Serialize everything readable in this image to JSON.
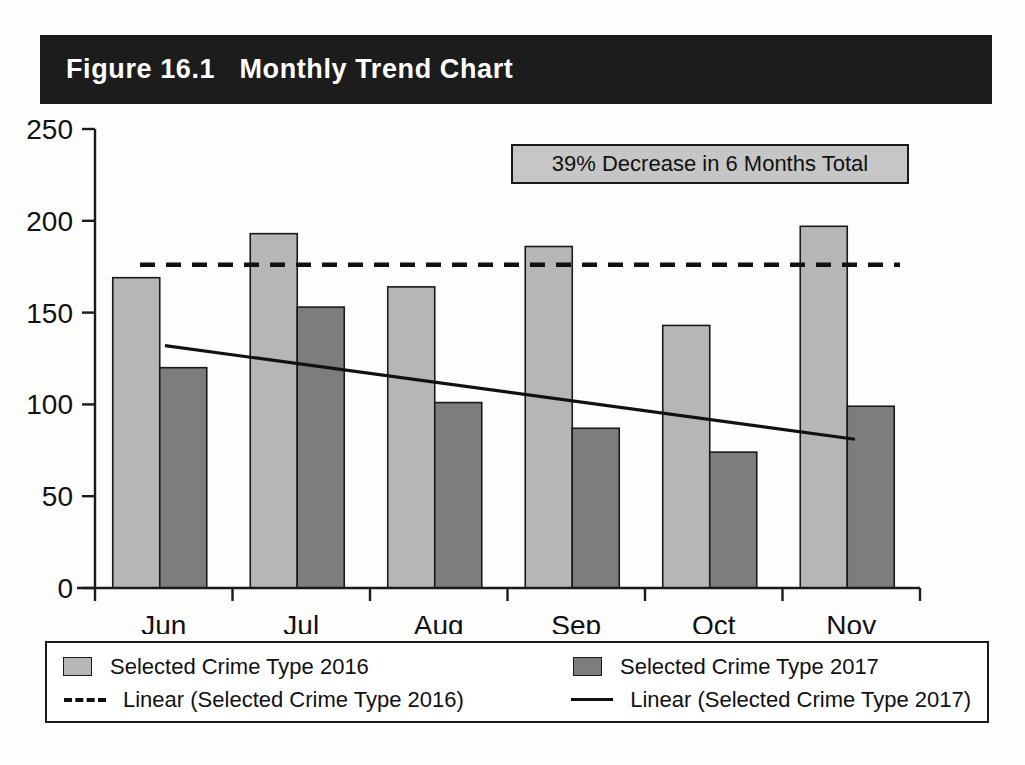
{
  "figure": {
    "title": "Figure 16.1   Monthly Trend Chart",
    "title_bg_color": "#1c1c1c",
    "title_text_color": "#ffffff"
  },
  "annotation": {
    "text": "39% Decrease in 6 Months Total",
    "bg_color": "#c6c6c6",
    "border_color": "#1a1a1a"
  },
  "legend": {
    "items": [
      {
        "label": "Selected Crime Type 2016",
        "key": "light-swatch",
        "color": "#b6b6b6"
      },
      {
        "label": "Selected Crime Type 2017",
        "key": "dark-swatch",
        "color": "#7d7d7d"
      },
      {
        "label": "Linear (Selected Crime Type 2016)",
        "key": "dashed-line",
        "color": "#111111"
      },
      {
        "label": "Linear (Selected Crime Type 2017)",
        "key": "solid-line",
        "color": "#111111"
      }
    ]
  },
  "axis": {
    "y_ticks": [
      "0",
      "50",
      "100",
      "150",
      "200",
      "250"
    ],
    "x_ticks": [
      "Jun",
      "Jul",
      "Aug",
      "Sep",
      "Oct",
      "Nov"
    ]
  },
  "chart_data": {
    "type": "bar",
    "title": "Figure 16.1   Monthly Trend Chart",
    "xlabel": "",
    "ylabel": "",
    "ylim": [
      0,
      250
    ],
    "ytick_step": 50,
    "grid": false,
    "legend_position": "bottom",
    "categories": [
      "Jun",
      "Jul",
      "Aug",
      "Sep",
      "Oct",
      "Nov"
    ],
    "series": [
      {
        "name": "Selected Crime Type 2016",
        "color": "#b6b6b6",
        "values": [
          169,
          193,
          164,
          186,
          143,
          197
        ]
      },
      {
        "name": "Selected Crime Type 2017",
        "color": "#7d7d7d",
        "values": [
          120,
          153,
          101,
          87,
          74,
          99
        ]
      }
    ],
    "trendlines": [
      {
        "name": "Linear (Selected Crime Type 2016)",
        "style": "dashed",
        "color": "#111111",
        "start_value": 176,
        "end_value": 176
      },
      {
        "name": "Linear (Selected Crime Type 2017)",
        "style": "solid",
        "color": "#111111",
        "start_value": 132,
        "end_value": 81
      }
    ],
    "annotations": [
      {
        "text": "39% Decrease in 6 Months Total"
      }
    ]
  }
}
